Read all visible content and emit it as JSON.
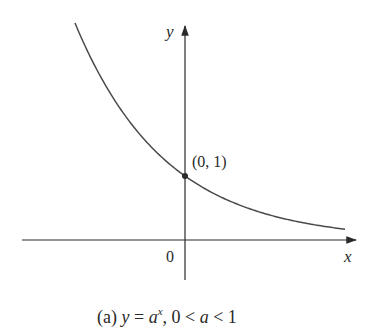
{
  "figure": {
    "caption_prefix": "(a)",
    "caption_eq_y": "y",
    "caption_eq_eq": " = ",
    "caption_eq_a": "a",
    "caption_eq_exp": "x",
    "caption_cond": ", 0 < ",
    "caption_cond_a": "a",
    "caption_cond_end": " < 1"
  },
  "axes": {
    "x_label": "x",
    "y_label": "y",
    "origin_label": "0"
  },
  "point": {
    "label": "(0, 1)"
  },
  "colors": {
    "curve": "#4a4a4a",
    "axis": "#2a2a2a",
    "text": "#2a2a2a"
  },
  "chart_data": {
    "type": "line",
    "xlabel": "x",
    "ylabel": "y",
    "function": "y = a^x with 0 < a < 1 (decreasing exponential)",
    "annotations": [
      {
        "text": "(0, 1)",
        "x": 0,
        "y": 1
      }
    ],
    "origin_label": "0",
    "grid": false
  }
}
